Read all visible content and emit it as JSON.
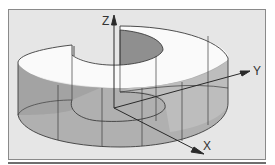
{
  "figure": {
    "axes": {
      "x_label": "X",
      "y_label": "Y",
      "z_label": "Z"
    },
    "colors": {
      "frame_background": "#e6e6e6",
      "frame_border": "#8a8a8a",
      "wall_gray": "#a9a9a9",
      "wall_light": "#c4c4c4",
      "top_white": "#fafafa",
      "inner_dark": "#8f8f8f",
      "stroke": "#3c3c3c",
      "bottom_rule": "#6e6e6e"
    }
  }
}
